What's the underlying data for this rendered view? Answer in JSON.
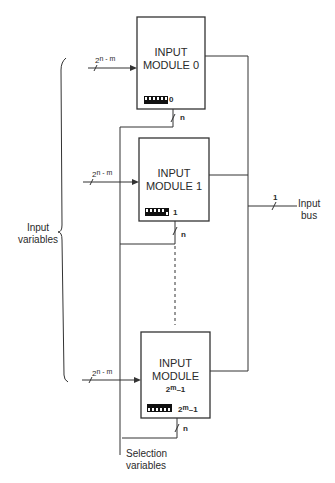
{
  "diagram": {
    "modules": [
      {
        "title_line1": "INPUT",
        "title_line2": "MODULE 0",
        "title_line3": "",
        "switch_label": "0",
        "input_bus_base": "2",
        "input_bus_exp": "n - m",
        "selection_width": "n"
      },
      {
        "title_line1": "INPUT",
        "title_line2": "MODULE 1",
        "title_line3": "",
        "switch_label": "1",
        "input_bus_base": "2",
        "input_bus_exp": "n - m",
        "selection_width": "n"
      },
      {
        "title_line1": "INPUT",
        "title_line2": "MODULE",
        "title_line3_base": "2",
        "title_line3_exp": "m",
        "title_line3_suffix": "–1",
        "switch_label_base": "2",
        "switch_label_exp": "m",
        "switch_label_suffix": "–1",
        "input_bus_base": "2",
        "input_bus_exp": "n - m",
        "selection_width": "n"
      }
    ],
    "input_variables_label_line1": "Input",
    "input_variables_label_line2": "variables",
    "output_bus_width": "1",
    "output_bus_label_line1": "Input",
    "output_bus_label_line2": "bus",
    "selection_label_line1": "Selection",
    "selection_label_line2": "variables"
  }
}
